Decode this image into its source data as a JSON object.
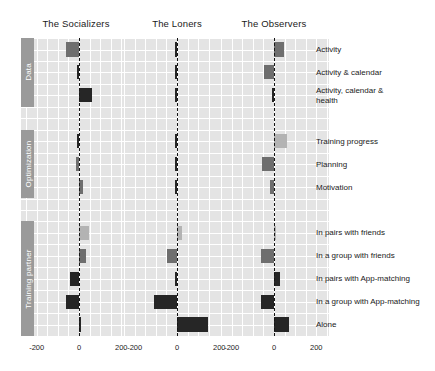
{
  "figure": {
    "panels": [
      {
        "label": "The Socializers",
        "x_center": 76
      },
      {
        "label": "The Loners",
        "x_center": 177
      },
      {
        "label": "The Observers",
        "x_center": 274
      }
    ],
    "sections": [
      {
        "label": "Data"
      },
      {
        "label": "Optimization"
      },
      {
        "label": "Training partner"
      }
    ],
    "row_labels": [
      "Activity",
      "Activity & calendar",
      "Activity, calendar &\nhealth",
      "Training progress",
      "Planning",
      "Motivation",
      "In pairs with friends",
      "In a group with friends",
      "In pairs with App-matching",
      "In a group with App-matching",
      "Alone"
    ],
    "tick_labels": [
      "-200",
      "0",
      "200"
    ],
    "colors": {
      "panel_background": "#e4e4e4",
      "gridline": "#ffffff",
      "zero_line": "#141414",
      "section_strip": "#9a9a9a",
      "bar_light": "#b3b3b3",
      "bar_medium": "#6e6e6e",
      "bar_dark": "#262626",
      "text": "#1a1a1a"
    }
  },
  "chart_data": {
    "type": "bar",
    "orientation": "horizontal",
    "title": "",
    "xlabel": "",
    "ylabel": "",
    "xlim": [
      -260,
      260
    ],
    "xticks": [
      -200,
      0,
      200
    ],
    "grid": true,
    "legend": "none",
    "facets": [
      "The Socializers",
      "The Loners",
      "The Observers"
    ],
    "sections": [
      {
        "name": "Data",
        "rows": [
          "Activity",
          "Activity & calendar",
          "Activity, calendar & health"
        ]
      },
      {
        "name": "Optimization",
        "rows": [
          "Training progress",
          "Planning",
          "Motivation"
        ]
      },
      {
        "name": "Training partner",
        "rows": [
          "In pairs with friends",
          "In a group with friends",
          "In pairs with App-matching",
          "In a group with App-matching",
          "Alone"
        ]
      }
    ],
    "categories": [
      "Activity",
      "Activity & calendar",
      "Activity, calendar & health",
      "Training progress",
      "Planning",
      "Motivation",
      "In pairs with friends",
      "In a group with friends",
      "In pairs with App-matching",
      "In a group with App-matching",
      "Alone"
    ],
    "series": [
      {
        "name": "The Socializers",
        "values": [
          -62,
          -5,
          62,
          -3,
          -12,
          20,
          45,
          35,
          -45,
          -62,
          2
        ],
        "shades": [
          "medium",
          "dark",
          "dark",
          "dark",
          "medium",
          "medium",
          "light",
          "medium",
          "dark",
          "dark",
          "dark"
        ]
      },
      {
        "name": "The Loners",
        "values": [
          -4,
          -3,
          -3,
          -3,
          -3,
          -3,
          25,
          -48,
          -6,
          -110,
          145
        ],
        "shades": [
          "dark",
          "dark",
          "dark",
          "dark",
          "dark",
          "dark",
          "light",
          "medium",
          "dark",
          "dark",
          "dark"
        ]
      },
      {
        "name": "The Observers",
        "values": [
          45,
          -48,
          -5,
          62,
          -55,
          -18,
          8,
          -62,
          28,
          -62,
          72
        ],
        "shades": [
          "medium",
          "medium",
          "dark",
          "light",
          "medium",
          "medium",
          "light",
          "medium",
          "dark",
          "dark",
          "dark"
        ]
      }
    ]
  }
}
